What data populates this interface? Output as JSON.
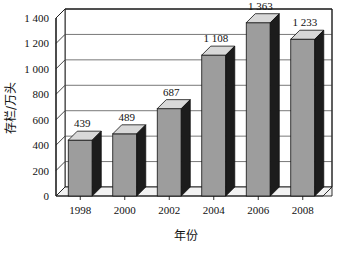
{
  "chart_data": {
    "type": "bar",
    "title": "",
    "subtitle": "",
    "xlabel": "年份",
    "ylabel": "存栏/万头",
    "categories": [
      "1998",
      "2000",
      "2002",
      "2004",
      "2006",
      "2008"
    ],
    "values": [
      439,
      489,
      687,
      1108,
      1363,
      1233
    ],
    "value_labels": [
      "439",
      "489",
      "687",
      "1 108",
      "1 363",
      "1 233"
    ],
    "ylim": [
      0,
      1400
    ],
    "ytick_values": [
      0,
      200,
      400,
      600,
      800,
      1000,
      1200,
      1400
    ],
    "ytick_labels": [
      "0",
      "200",
      "400",
      "600",
      "800",
      "1 000",
      "1 200",
      "1 400"
    ],
    "grid": true,
    "legend": null,
    "style": "3d-column",
    "colors": {
      "bar_front": "#9d9d9d",
      "bar_top": "#d8d8d8",
      "bar_side": "#1c1c1c",
      "axis": "#1a1a1a",
      "grid": "#555555",
      "wall": "#ffffff",
      "floor": "#f2f2f2",
      "text": "#111111",
      "background": "#ffffff"
    }
  }
}
